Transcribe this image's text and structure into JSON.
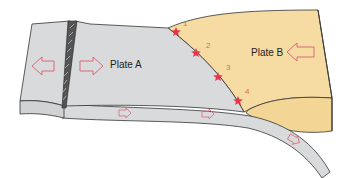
{
  "diagram": {
    "labels": {
      "plate_a": "Plate A",
      "plate_b": "Plate B"
    },
    "earthquakes": [
      {
        "id": "1",
        "x": 176,
        "y": 32,
        "lx": 183,
        "ly": 26
      },
      {
        "id": "2",
        "x": 196,
        "y": 53,
        "lx": 206,
        "ly": 48
      },
      {
        "id": "3",
        "x": 218,
        "y": 77,
        "lx": 226,
        "ly": 70
      },
      {
        "id": "4",
        "x": 238,
        "y": 101,
        "lx": 245,
        "ly": 94
      }
    ],
    "colors": {
      "plate_a": "#d9dadc",
      "plate_b": "#f6dba2",
      "outline": "#333333",
      "arrow": "#d96a7a",
      "star": "#e8334a",
      "number": "#e06a5a"
    },
    "arrows": [
      {
        "name": "plate-a-left-arrow",
        "direction": "left",
        "size": "large"
      },
      {
        "name": "plate-a-right-arrow",
        "direction": "right",
        "size": "large"
      },
      {
        "name": "plate-b-left-arrow",
        "direction": "left",
        "size": "large"
      },
      {
        "name": "slab-arrow-1",
        "direction": "right",
        "size": "small"
      },
      {
        "name": "slab-arrow-2",
        "direction": "right",
        "size": "small"
      },
      {
        "name": "slab-arrow-3",
        "direction": "down-right",
        "size": "small"
      }
    ]
  }
}
